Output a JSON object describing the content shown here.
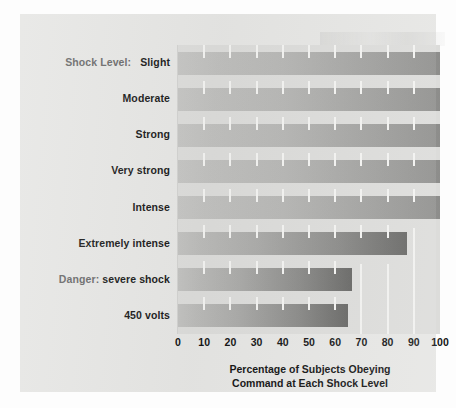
{
  "figure": {
    "background_color": "#e6e6e4",
    "panel_color": "#e6e6e4"
  },
  "axis": {
    "title_line1": "Percentage of Subjects Obeying",
    "title_line2": "Command at Each Shock Level",
    "tick_labels": [
      "0",
      "10",
      "20",
      "30",
      "40",
      "50",
      "60",
      "70",
      "80",
      "90",
      "100"
    ],
    "category_prefix": "Shock Level:"
  },
  "chart_data": {
    "type": "bar",
    "orientation": "horizontal",
    "title": "",
    "subtitle": "",
    "xlabel": "Percentage of Subjects Obeying Command at Each Shock Level",
    "ylabel": "Shock Level:",
    "xlim": [
      0,
      100
    ],
    "xticks": [
      0,
      10,
      20,
      30,
      40,
      50,
      60,
      70,
      80,
      90,
      100
    ],
    "grid": true,
    "legend": "none",
    "categories": [
      "Slight",
      "Moderate",
      "Strong",
      "Very strong",
      "Intense",
      "Extremely intense",
      "Danger: severe shock",
      "450 volts"
    ],
    "values": [
      100,
      100,
      100,
      100,
      100,
      87.5,
      66.5,
      65
    ],
    "bar_colors": {
      "gradient_start": "#c9c9c7",
      "gradient_end": "#6e6e6c"
    },
    "plot_background": "#dcdcda"
  },
  "categories_display": [
    {
      "prefix": "Shock Level:",
      "label": "Slight",
      "value": 100
    },
    {
      "prefix": "",
      "label": "Moderate",
      "value": 100
    },
    {
      "prefix": "",
      "label": "Strong",
      "value": 100
    },
    {
      "prefix": "",
      "label": "Very strong",
      "value": 100
    },
    {
      "prefix": "",
      "label": "Intense",
      "value": 100
    },
    {
      "prefix": "",
      "label": "Extremely intense",
      "value": 87.5
    },
    {
      "prefix": "Danger:",
      "label": "severe shock",
      "value": 66.5
    },
    {
      "prefix": "",
      "label": "450 volts",
      "value": 65
    }
  ]
}
